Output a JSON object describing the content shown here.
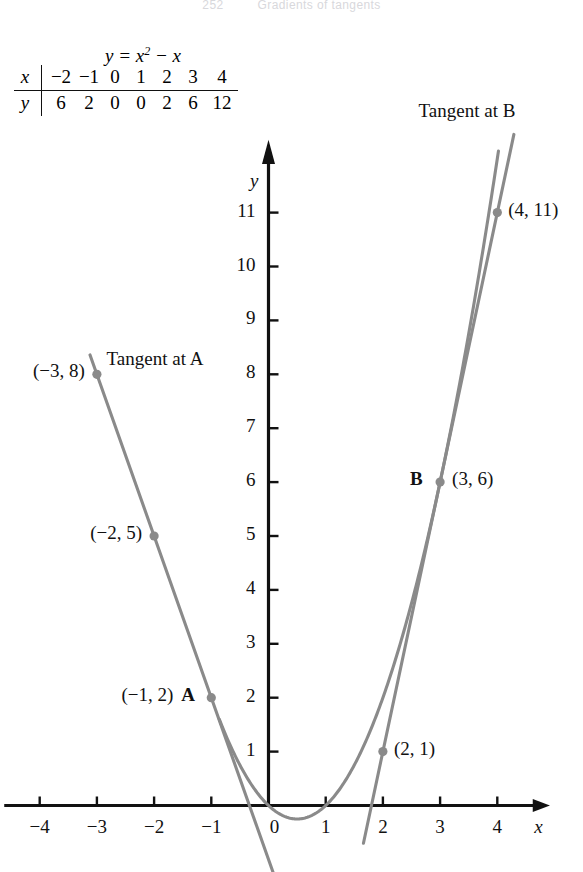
{
  "running_head": {
    "page_number": "252",
    "title": "Gradients of tangents"
  },
  "table": {
    "caption_prefix": "y = x",
    "caption_exponent": "2",
    "caption_suffix": " − x",
    "row_head_x": "x",
    "row_head_y": "y",
    "x_values": [
      "−2",
      "−1",
      "0",
      "1",
      "2",
      "3",
      "4"
    ],
    "y_values": [
      "6",
      "2",
      "0",
      "0",
      "2",
      "6",
      "12"
    ]
  },
  "graph": {
    "x_axis_label": "x",
    "y_axis_label": "y",
    "x_ticks": [
      {
        "value": -4,
        "label": "−4"
      },
      {
        "value": -3,
        "label": "−3"
      },
      {
        "value": -2,
        "label": "−2"
      },
      {
        "value": -1,
        "label": "−1"
      },
      {
        "value": 0,
        "label": "0"
      },
      {
        "value": 1,
        "label": "1"
      },
      {
        "value": 2,
        "label": "2"
      },
      {
        "value": 3,
        "label": "3"
      },
      {
        "value": 4,
        "label": "4"
      }
    ],
    "y_ticks": [
      {
        "value": 1,
        "label": "1"
      },
      {
        "value": 2,
        "label": "2"
      },
      {
        "value": 3,
        "label": "3"
      },
      {
        "value": 4,
        "label": "4"
      },
      {
        "value": 5,
        "label": "5"
      },
      {
        "value": 6,
        "label": "6"
      },
      {
        "value": 7,
        "label": "7"
      },
      {
        "value": 8,
        "label": "8"
      },
      {
        "value": 9,
        "label": "9"
      },
      {
        "value": 10,
        "label": "10"
      },
      {
        "value": 11,
        "label": "11"
      }
    ],
    "tangent_a_label": "Tangent at A",
    "tangent_b_label": "Tangent at B",
    "point_letter_a": "A",
    "point_letter_b": "B",
    "annotations": [
      {
        "label": "(−3, 8)",
        "x": -3,
        "y": 8
      },
      {
        "label": "(−2, 5)",
        "x": -2,
        "y": 5
      },
      {
        "label": "(−1, 2)",
        "x": -1,
        "y": 2
      },
      {
        "label": "(2, 1)",
        "x": 2,
        "y": 1
      },
      {
        "label": "(3, 6)",
        "x": 3,
        "y": 6
      },
      {
        "label": "(4, 11)",
        "x": 4,
        "y": 11
      }
    ],
    "curve_color": "#8a8a8a",
    "axis_color": "#111111",
    "marker_color": "#8a8a8a"
  },
  "chart_data": {
    "type": "line",
    "xlabel": "x",
    "ylabel": "y",
    "xlim": [
      -4.6,
      4.9
    ],
    "ylim": [
      -0.6,
      12.4
    ],
    "grid": false,
    "legend": "none",
    "series": [
      {
        "name": "y = x^2 - x",
        "kind": "parabola",
        "x": [
          -2,
          -1,
          0,
          1,
          2,
          3,
          4
        ],
        "values": [
          6,
          2,
          0,
          0,
          2,
          6,
          12
        ]
      },
      {
        "name": "Tangent at A",
        "kind": "line",
        "touch_point": [
          -1,
          2
        ],
        "slope": -3,
        "x": [
          -3.1,
          0.4
        ],
        "values": [
          8.3,
          -2.2
        ]
      },
      {
        "name": "Tangent at B",
        "kind": "line",
        "touch_point": [
          3,
          6
        ],
        "slope": 5,
        "x": [
          1.7,
          4.3
        ],
        "values": [
          -0.5,
          12.5
        ]
      }
    ],
    "annotated_points": [
      {
        "label": "(−3, 8)",
        "x": -3,
        "y": 8,
        "on": "Tangent at A"
      },
      {
        "label": "(−2, 5)",
        "x": -2,
        "y": 5,
        "on": "Tangent at A"
      },
      {
        "label": "(−1, 2)",
        "x": -1,
        "y": 2,
        "on": "A / curve"
      },
      {
        "label": "(2, 1)",
        "x": 2,
        "y": 1,
        "on": "Tangent at B"
      },
      {
        "label": "(3, 6)",
        "x": 3,
        "y": 6,
        "on": "B / curve"
      },
      {
        "label": "(4, 11)",
        "x": 4,
        "y": 11,
        "on": "Tangent at B"
      }
    ],
    "xticks": [
      -4,
      -3,
      -2,
      -1,
      0,
      1,
      2,
      3,
      4
    ],
    "yticks": [
      1,
      2,
      3,
      4,
      5,
      6,
      7,
      8,
      9,
      10,
      11
    ]
  }
}
